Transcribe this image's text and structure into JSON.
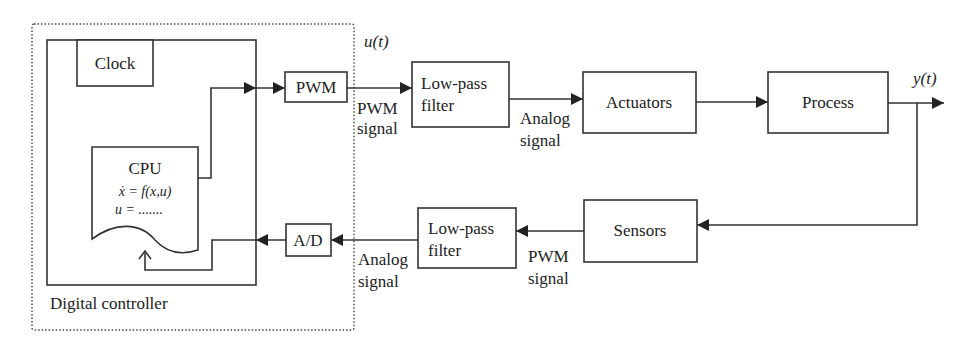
{
  "diagram": {
    "type": "block-diagram",
    "title": "",
    "colors": {
      "stroke": "#333333",
      "text": "#222222",
      "background": "#ffffff"
    },
    "controller": {
      "outer_label": "Digital controller",
      "clock_label": "Clock",
      "cpu_label": "CPU",
      "cpu_eq1": "ẋ = f(x,u)",
      "cpu_eq2": "u = .......",
      "pwm_label": "PWM",
      "ad_label": "A/D"
    },
    "forward_path": {
      "u_label": "u(t)",
      "pwm_signal_line1": "PWM",
      "pwm_signal_line2": "signal",
      "lpf_line1": "Low-pass",
      "lpf_line2": "filter",
      "analog_signal_line1": "Analog",
      "analog_signal_line2": "signal",
      "actuators_label": "Actuators",
      "process_label": "Process",
      "y_label": "y(t)"
    },
    "feedback_path": {
      "sensors_label": "Sensors",
      "pwm_signal_line1": "PWM",
      "pwm_signal_line2": "signal",
      "lpf_line1": "Low-pass",
      "lpf_line2": "filter",
      "analog_signal_line1": "Analog",
      "analog_signal_line2": "signal"
    },
    "nodes": [
      "Clock",
      "CPU",
      "PWM",
      "A/D",
      "Low-pass filter (forward)",
      "Actuators",
      "Process",
      "Sensors",
      "Low-pass filter (feedback)"
    ],
    "edges": [
      [
        "CPU",
        "PWM"
      ],
      [
        "PWM",
        "Low-pass filter (forward)",
        "PWM signal"
      ],
      [
        "Low-pass filter (forward)",
        "Actuators",
        "Analog signal"
      ],
      [
        "Actuators",
        "Process"
      ],
      [
        "Process",
        "y(t)"
      ],
      [
        "Process",
        "Sensors"
      ],
      [
        "Sensors",
        "Low-pass filter (feedback)",
        "PWM signal"
      ],
      [
        "Low-pass filter (feedback)",
        "A/D",
        "Analog signal"
      ],
      [
        "A/D",
        "CPU"
      ]
    ]
  }
}
